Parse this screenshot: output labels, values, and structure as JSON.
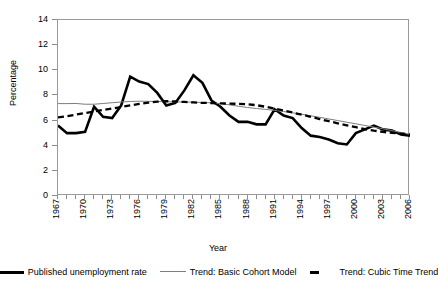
{
  "chart_data": {
    "type": "line",
    "title": "",
    "xlabel": "Year",
    "ylabel": "Percentage",
    "ylim": [
      0,
      14
    ],
    "xlim": [
      1967,
      2006
    ],
    "yticks": [
      0,
      2,
      4,
      6,
      8,
      10,
      12,
      14
    ],
    "xticks": [
      "1967",
      "1970",
      "1973",
      "1976",
      "1979",
      "1982",
      "1985",
      "1988",
      "1991",
      "1994",
      "1997",
      "2000",
      "2003",
      "2006"
    ],
    "grid": false,
    "legend_position": "bottom",
    "x": [
      1967,
      1968,
      1969,
      1970,
      1971,
      1972,
      1973,
      1974,
      1975,
      1976,
      1977,
      1978,
      1979,
      1980,
      1981,
      1982,
      1983,
      1984,
      1985,
      1986,
      1987,
      1988,
      1989,
      1990,
      1991,
      1992,
      1993,
      1994,
      1995,
      1996,
      1997,
      1998,
      1999,
      2000,
      2001,
      2002,
      2003,
      2004,
      2005,
      2006
    ],
    "series": [
      {
        "name": "Published unemployment rate",
        "style": "thick-solid",
        "color": "#000000",
        "values": [
          5.6,
          5.0,
          5.0,
          5.1,
          7.1,
          6.3,
          6.2,
          7.2,
          9.5,
          9.1,
          8.9,
          8.2,
          7.2,
          7.4,
          8.4,
          9.6,
          9.0,
          7.6,
          7.1,
          6.4,
          5.9,
          5.9,
          5.7,
          5.7,
          6.9,
          6.4,
          6.2,
          5.4,
          4.8,
          4.7,
          4.5,
          4.2,
          4.1,
          5.0,
          5.3,
          5.6,
          5.3,
          5.2,
          4.9,
          4.8
        ]
      },
      {
        "name": "Trend: Basic Cohort Model",
        "style": "thin-solid",
        "color": "#7d7d7d",
        "values": [
          7.35,
          7.35,
          7.36,
          7.3,
          7.3,
          7.36,
          7.42,
          7.48,
          7.52,
          7.54,
          7.53,
          7.52,
          7.5,
          7.49,
          7.48,
          7.46,
          7.44,
          7.41,
          7.35,
          7.25,
          7.14,
          7.04,
          6.96,
          6.89,
          6.81,
          6.72,
          6.62,
          6.5,
          6.38,
          6.26,
          6.13,
          6.0,
          5.87,
          5.74,
          5.61,
          5.48,
          5.35,
          5.2,
          5.05,
          4.9
        ]
      },
      {
        "name": "Trend: Cubic Time Trend",
        "style": "thick-dashed",
        "color": "#000000",
        "values": [
          6.25,
          6.35,
          6.48,
          6.6,
          6.72,
          6.84,
          6.96,
          7.08,
          7.2,
          7.32,
          7.42,
          7.5,
          7.54,
          7.52,
          7.48,
          7.44,
          7.41,
          7.39,
          7.37,
          7.35,
          7.33,
          7.3,
          7.22,
          7.1,
          6.96,
          6.8,
          6.64,
          6.47,
          6.3,
          6.12,
          5.95,
          5.78,
          5.62,
          5.47,
          5.32,
          5.2,
          5.1,
          5.02,
          4.96,
          4.9
        ]
      }
    ]
  },
  "axes": {
    "y_title": "Percentage",
    "x_title": "Year"
  },
  "legend": {
    "items": [
      {
        "label": "Published unemployment rate"
      },
      {
        "label": "Trend:  Basic Cohort Model"
      },
      {
        "label": "Trend:  Cubic Time Trend"
      }
    ]
  }
}
